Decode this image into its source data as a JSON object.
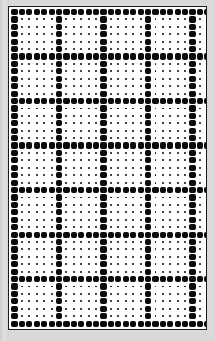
{
  "canvas": {
    "width": 215,
    "height": 341,
    "margin_color": "#d9d9d9",
    "description": "halftone dot grid pattern"
  },
  "panel": {
    "left": 8,
    "top": 6,
    "width": 199,
    "height": 324,
    "background_color": "#ffffff",
    "border_color": "#1c1c1c",
    "border_width": 1
  },
  "grid": {
    "columns": 27,
    "rows": 43,
    "pitch_x": 7.42,
    "pitch_y": 7.42,
    "origin_x": 5.5,
    "origin_y": 5.0,
    "major_interval_x": 6,
    "major_interval_y": 6,
    "major_offset_x": 0,
    "major_offset_y": 0,
    "major_dot_size": 6.2,
    "minor_dot_size": 1.9,
    "dot_color": "#0b0b0b",
    "rule": "a dot is drawn large when its column index OR its row index falls on a major interval; otherwise it is drawn small"
  }
}
